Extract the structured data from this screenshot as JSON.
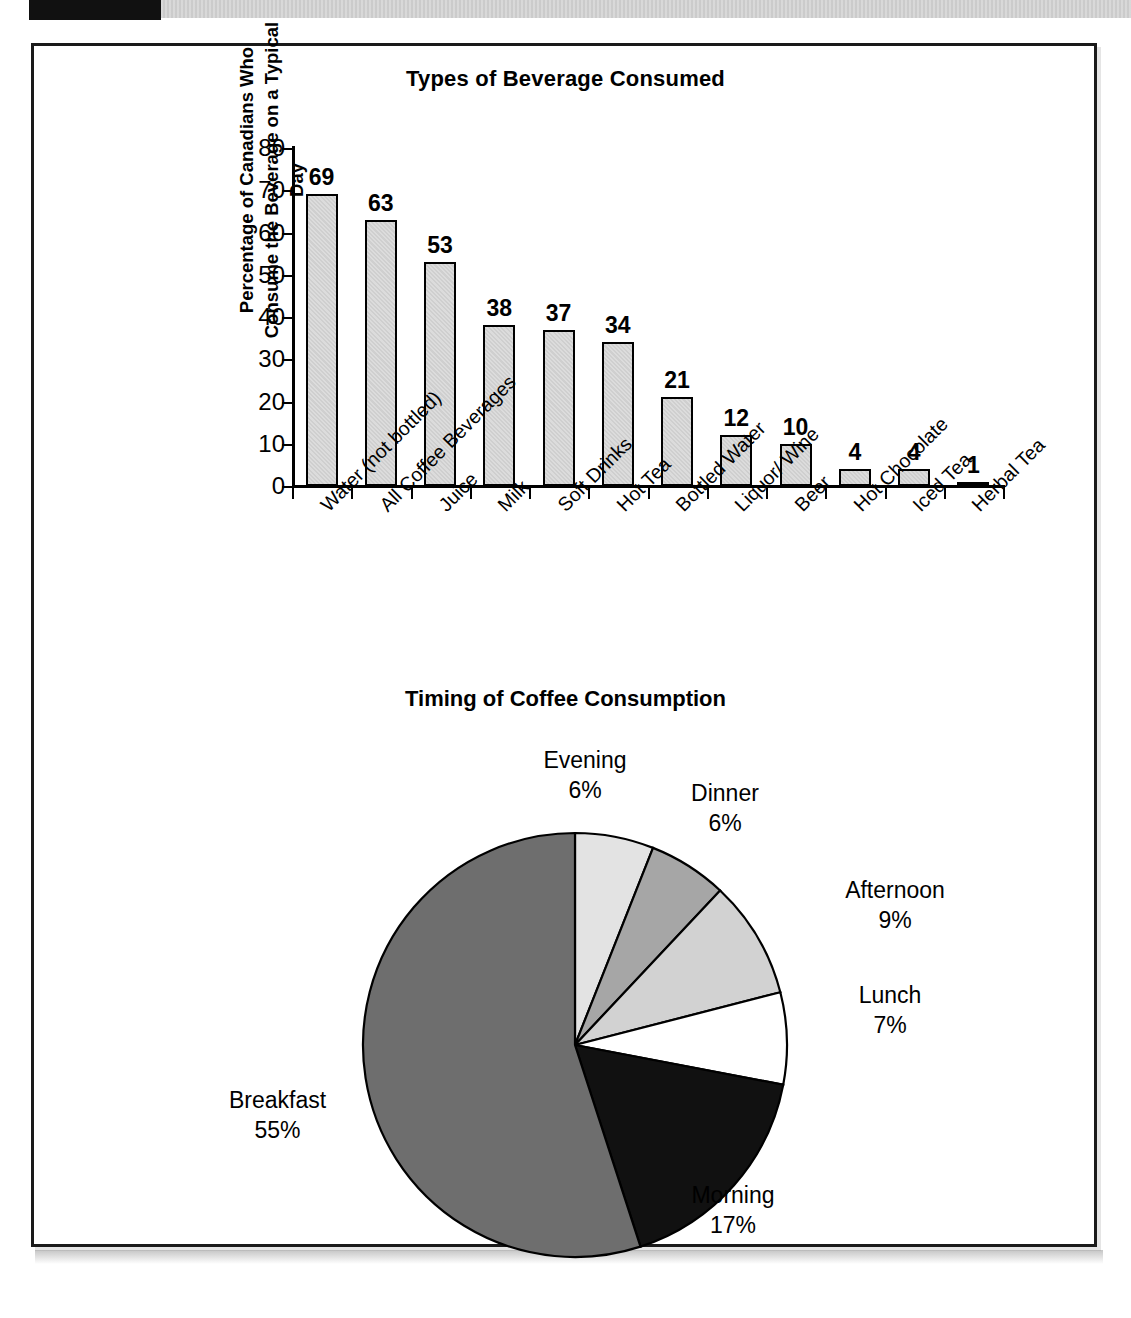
{
  "document": {
    "frame_color": "#1a1a1a",
    "background": "#ffffff"
  },
  "bar_chart_title": "Types of Beverage Consumed",
  "bar_y_axis_label": "Percentage of Canadians Who Consume the Beverage on a Typical Day",
  "pie_chart_title": "Timing of Coffee Consumption",
  "chart_data": [
    {
      "type": "bar",
      "title": "Types of Beverage Consumed",
      "xlabel": "",
      "ylabel": "Percentage of Canadians Who Consume the Beverage on a Typical Day",
      "ylim": [
        0,
        80
      ],
      "yticks": [
        0,
        10,
        20,
        30,
        40,
        50,
        60,
        70,
        80
      ],
      "grid": false,
      "legend": "none",
      "bar_fill": "#d4d4d4",
      "bar_border": "#000000",
      "categories": [
        "Water (not bottled)",
        "All Coffee Beverages",
        "Juice",
        "Milk",
        "Soft Drinks",
        "Hot Tea",
        "Bottled Water",
        "Liquor/ Wine",
        "Beer",
        "Hot Chocolate",
        "Iced Tea",
        "Herbal Tea"
      ],
      "values": [
        69,
        63,
        53,
        38,
        37,
        34,
        21,
        12,
        10,
        4,
        4,
        1
      ],
      "value_labels": [
        "69",
        "63",
        "53",
        "38",
        "37",
        "34",
        "21",
        "12",
        "10",
        "4",
        "4",
        "1"
      ]
    },
    {
      "type": "pie",
      "title": "Timing of Coffee Consumption",
      "start_angle_deg": 0,
      "direction": "clockwise",
      "legend": "none",
      "slices": [
        {
          "label": "Evening",
          "value": 6,
          "value_label": "6%",
          "color": "#e3e3e3"
        },
        {
          "label": "Dinner",
          "value": 6,
          "value_label": "6%",
          "color": "#a6a6a6"
        },
        {
          "label": "Afternoon",
          "value": 9,
          "value_label": "9%",
          "color": "#d2d2d2"
        },
        {
          "label": "Lunch",
          "value": 7,
          "value_label": "7%",
          "color": "#ffffff"
        },
        {
          "label": "Morning",
          "value": 17,
          "value_label": "17%",
          "color": "#111111"
        },
        {
          "label": "Breakfast",
          "value": 55,
          "value_label": "55%",
          "color": "#6e6e6e"
        }
      ]
    }
  ]
}
